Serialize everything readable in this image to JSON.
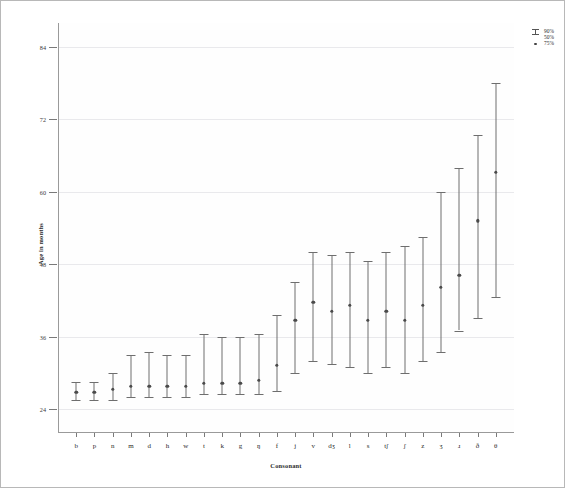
{
  "chart_data": {
    "type": "scatter",
    "title": "",
    "xlabel": "Consonant",
    "ylabel": "Age in months",
    "ylim": [
      20,
      88
    ],
    "yticks": [
      24,
      36,
      48,
      60,
      72,
      84
    ],
    "grid": true,
    "legend_position": "top-right",
    "legend": [
      {
        "symbol": "whisker-cap",
        "label": "90%"
      },
      {
        "symbol": "whisker-cap",
        "label": "50%"
      },
      {
        "symbol": "dot",
        "label": "75%"
      }
    ],
    "categories": [
      "b",
      "p",
      "n",
      "m",
      "d",
      "h",
      "w",
      "t",
      "k",
      "g",
      "ŋ",
      "f",
      "j",
      "v",
      "dʒ",
      "l",
      "s",
      "tʃ",
      "ʃ",
      "z",
      "ʒ",
      "ɹ",
      "ð",
      "θ"
    ],
    "series": [
      {
        "name": "50%",
        "values": [
          27.0,
          27.0,
          27.5,
          28.0,
          28.0,
          28.0,
          28.0,
          28.5,
          28.5,
          28.5,
          29.0,
          31.5,
          39.0,
          42.0,
          40.5,
          41.5,
          39.0,
          40.5,
          39.0,
          41.5,
          44.5,
          46.5,
          55.5,
          63.5
        ]
      },
      {
        "name": "25%",
        "values": [
          25.5,
          25.5,
          25.5,
          26.0,
          26.0,
          26.0,
          26.0,
          26.5,
          26.5,
          26.5,
          26.5,
          27.0,
          30.0,
          32.0,
          31.5,
          31.0,
          30.0,
          31.0,
          30.0,
          32.0,
          33.5,
          37.0,
          39.0,
          42.5
        ]
      },
      {
        "name": "90%",
        "values": [
          28.5,
          28.5,
          30.0,
          33.0,
          33.5,
          33.0,
          33.0,
          36.5,
          36.0,
          36.0,
          36.5,
          39.5,
          45.0,
          50.0,
          49.5,
          50.0,
          48.5,
          50.0,
          51.0,
          52.5,
          60.0,
          64.0,
          69.5,
          78.0
        ]
      }
    ]
  },
  "axis": {
    "y_title": "Age in months",
    "x_title": "Consonant",
    "y_tick_labels": [
      "84",
      "72",
      "60",
      "48",
      "36",
      "24"
    ]
  }
}
